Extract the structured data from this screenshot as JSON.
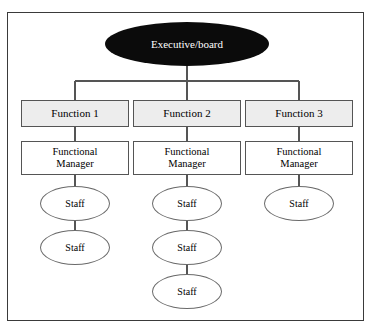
{
  "diagram": {
    "type": "organizational-chart",
    "style": {
      "frame_border_color": "#3a3a3a",
      "background_color": "#ffffff",
      "executive_fill": "#0b0b0b",
      "executive_text_color": "#ffffff",
      "function_fill": "#ededed",
      "manager_fill": "#ffffff",
      "staff_fill": "#ffffff",
      "line_color": "#555555"
    },
    "root": {
      "label": "Executive/board",
      "shape": "ellipse"
    },
    "columns": [
      {
        "function": {
          "label": "Function 1",
          "shape": "rectangle"
        },
        "manager": {
          "line1": "Functional",
          "line2": "Manager",
          "shape": "rectangle"
        },
        "staff": [
          {
            "label": "Staff",
            "shape": "ellipse"
          },
          {
            "label": "Staff",
            "shape": "ellipse"
          }
        ]
      },
      {
        "function": {
          "label": "Function 2",
          "shape": "rectangle"
        },
        "manager": {
          "line1": "Functional",
          "line2": "Manager",
          "shape": "rectangle"
        },
        "staff": [
          {
            "label": "Staff",
            "shape": "ellipse"
          },
          {
            "label": "Staff",
            "shape": "ellipse"
          },
          {
            "label": "Staff",
            "shape": "ellipse"
          }
        ]
      },
      {
        "function": {
          "label": "Function 3",
          "shape": "rectangle"
        },
        "manager": {
          "line1": "Functional",
          "line2": "Manager",
          "shape": "rectangle"
        },
        "staff": [
          {
            "label": "Staff",
            "shape": "ellipse"
          }
        ]
      }
    ]
  }
}
